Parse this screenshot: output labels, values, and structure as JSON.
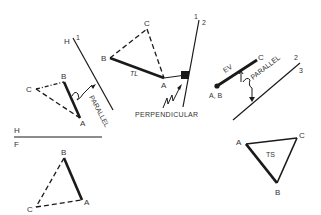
{
  "diagram": {
    "colors": {
      "line": "#1a1a1a",
      "text": "#333333",
      "background": "#ffffff"
    },
    "folding_lines": {
      "h1": {
        "label_left": "H",
        "label_right": "1"
      },
      "line12": {
        "label_left": "1",
        "label_right": "2"
      },
      "hf": {
        "label_top": "H",
        "label_bottom": "F"
      },
      "line23": {
        "label_top": "2",
        "label_bottom": "3"
      }
    },
    "views": {
      "horizontal": {
        "vertices": {
          "a": "A",
          "b": "B",
          "c": "C"
        },
        "arrow_label": "PARALLEL"
      },
      "auxiliary1": {
        "vertices": {
          "a": "A",
          "b": "B",
          "c": "C"
        },
        "edge_label": "TL",
        "arrow_label": "PERPENDICULAR"
      },
      "auxiliary2": {
        "point_label": "A, B",
        "c_label": "C",
        "edge_label": "EV",
        "arrow_label": "PARALLEL"
      },
      "auxiliary3": {
        "vertices": {
          "a": "A",
          "b": "B",
          "c": "C"
        },
        "face_label": "TS"
      },
      "frontal": {
        "vertices": {
          "a": "A",
          "b": "B",
          "c": "C"
        }
      }
    }
  }
}
